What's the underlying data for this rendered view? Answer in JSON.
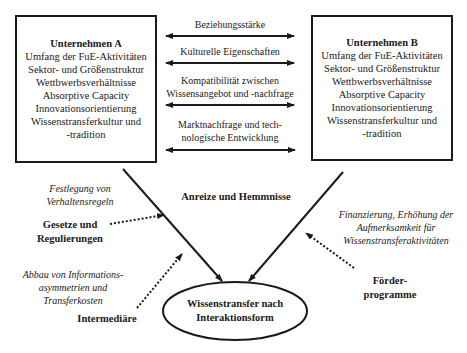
{
  "company_a": {
    "title": "Unternehmen A",
    "lines": [
      "Umfang der FuE-Aktivitäten",
      "Sektor- und Größenstruktur",
      "Wettbwerbsverhältnisse",
      "Absorptive Capacity",
      "Innovationsorientierung",
      "Wissenstransferkultur und",
      "-tradition"
    ]
  },
  "company_b": {
    "title": "Unternehmen B",
    "lines": [
      "Umfang der FuE-Aktivitäten",
      "Sektor- und Größenstruktur",
      "Wettbwerbsverhältnisse",
      "Absorptive Capacity",
      "Innovationsorientierung",
      "Wissenstransferkultur und",
      "-tradition"
    ]
  },
  "relations": [
    {
      "line1": "Beziehungsstärke",
      "line2": ""
    },
    {
      "line1": "Kulturelle Eigenschaften",
      "line2": ""
    },
    {
      "line1": "Kompatibilität zwischen",
      "line2": "Wissensangebot und -nachfrage"
    },
    {
      "line1": "Marktnachfrage und tech-",
      "line2": "nologische Entwicklung"
    }
  ],
  "center_label": "Anreize und Hemmnisse",
  "outcome": {
    "line1": "Wissenstransfer nach",
    "line2": "Interaktionsform"
  },
  "influences": {
    "laws": {
      "label_line1": "Gesetze und",
      "label_line2": "Regulierungen",
      "effect_line1": "Festlegung von",
      "effect_line2": "Verhaltensregeln"
    },
    "intermediaries": {
      "label": "Intermediäre",
      "effect_line1": "Abbau von Informations-",
      "effect_line2": "asymmetrien und",
      "effect_line3": "Transferkosten"
    },
    "funding": {
      "label_line1": "Förder-",
      "label_line2": "programme",
      "effect_line1": "Finanzierung, Erhöhung der",
      "effect_line2": "Aufmerksamkeit für",
      "effect_line3": "Wissenstransferaktivitäten"
    }
  }
}
